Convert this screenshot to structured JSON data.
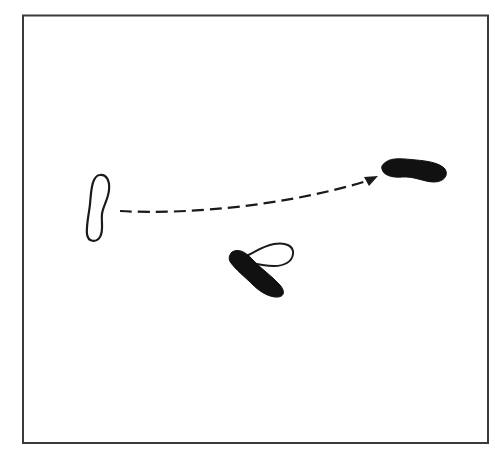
{
  "diagram": {
    "type": "footprint-movement",
    "frame": {
      "x": 23,
      "y": 15,
      "width": 465,
      "height": 428,
      "stroke": "#3a3a3a"
    },
    "colors": {
      "outline": "#1a1a1a",
      "filled_foot": "#111111",
      "open_foot": "#ffffff",
      "arrow": "#1a1a1a"
    },
    "footprints": [
      {
        "id": "start-foot",
        "style": "outline",
        "description": "open footprint at left, vertical orientation"
      },
      {
        "id": "end-foot",
        "style": "filled",
        "description": "solid footprint at right, horizontal orientation"
      },
      {
        "id": "pivot-foot-outline",
        "style": "outline",
        "description": "open footprint angled near center bottom"
      },
      {
        "id": "pivot-foot-filled",
        "style": "filled",
        "description": "solid footprint angled near center bottom"
      }
    ],
    "arrow": {
      "style": "dashed",
      "direction": "left-to-right",
      "from": "start-foot",
      "to": "end-foot"
    }
  }
}
